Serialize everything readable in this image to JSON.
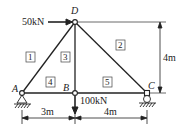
{
  "diagram": {
    "type": "truss",
    "nodes": [
      {
        "id": "A",
        "label": "A",
        "support": "pin"
      },
      {
        "id": "B",
        "label": "B"
      },
      {
        "id": "C",
        "label": "C",
        "support": "roller"
      },
      {
        "id": "D",
        "label": "D"
      }
    ],
    "members": [
      {
        "num": "1",
        "from": "A",
        "to": "D"
      },
      {
        "num": "2",
        "from": "D",
        "to": "C"
      },
      {
        "num": "3",
        "from": "B",
        "to": "D"
      },
      {
        "num": "4",
        "from": "A",
        "to": "B"
      },
      {
        "num": "5",
        "from": "B",
        "to": "C"
      }
    ],
    "loads": [
      {
        "at": "D",
        "label": "50kN",
        "direction": "right"
      },
      {
        "at": "B",
        "label": "100kN",
        "direction": "down"
      }
    ],
    "dimensions": {
      "AB": "3m",
      "BC": "4m",
      "height": "4m"
    },
    "colors": {
      "line": "#222222",
      "background": "#ffffff"
    }
  }
}
